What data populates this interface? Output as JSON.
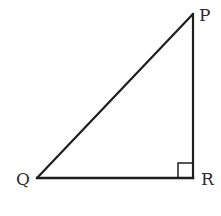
{
  "diagram": {
    "type": "right-triangle",
    "vertices": [
      {
        "label": "P",
        "x": 193,
        "y": 14
      },
      {
        "label": "Q",
        "x": 37,
        "y": 178
      },
      {
        "label": "R",
        "x": 193,
        "y": 178
      }
    ],
    "right_angle_at": "R",
    "sides": [
      "PQ",
      "QR",
      "RP"
    ],
    "colors": {
      "stroke": "#1e1e1e",
      "label": "#2b2b2b",
      "background": "#ffffff"
    }
  },
  "labels": {
    "p": "P",
    "q": "Q",
    "r": "R"
  }
}
